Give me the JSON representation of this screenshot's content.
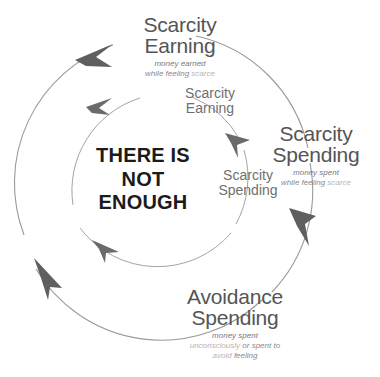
{
  "diagram": {
    "title_center": {
      "lines": [
        "THERE IS",
        "NOT",
        "ENOUGH"
      ]
    },
    "colors": {
      "center_text": "#1b1b1b",
      "major_label": "#555555",
      "minor_label": "#6f6f6f",
      "subtitle": "#7a7a7a",
      "subtitle_faint": "#b4b4b4",
      "circle_stroke": "#9a9a9a",
      "arrow_fill": "#5f5f5f",
      "background": "#ffffff"
    },
    "stages": {
      "scarcity_earning_outer": {
        "line1": "Scarcity",
        "line2": "Earning",
        "sub1": "money earned",
        "sub2_a": "while feeling ",
        "sub2_b": "scarce"
      },
      "scarcity_earning_inner": {
        "line1": "Scarcity",
        "line2": "Earning"
      },
      "scarcity_spending_outer": {
        "line1": "Scarcity",
        "line2": "Spending",
        "sub1": "money spent",
        "sub2_a": "while feeling ",
        "sub2_b": "scarce"
      },
      "scarcity_spending_inner": {
        "line1": "Scarcity",
        "line2": "Spending"
      },
      "avoidance_spending_outer": {
        "line1": "Avoidance",
        "line2": "Spending",
        "sub1": "money spent",
        "sub2_a": "unconsciously ",
        "sub2_b": "or spent to",
        "sub3_a": "avoid ",
        "sub3_b": "feeling"
      }
    },
    "icons": {
      "outer_loop": "clockwise-circular-arrow-icon",
      "inner_loop": "clockwise-circular-arrow-icon"
    }
  }
}
